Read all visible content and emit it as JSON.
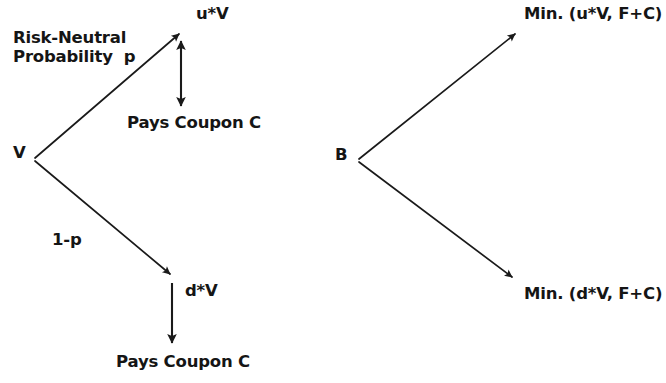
{
  "figure": {
    "background_color": "#ffffff",
    "ink_color": "#1a1a1a"
  },
  "left_panel": {
    "name": "firm-value-tree",
    "root_node": "V",
    "up_branch": {
      "probability_label": "Risk-Neutral\nProbability  p",
      "outcome_label": "u*V",
      "coupon_label": "Pays Coupon C"
    },
    "down_branch": {
      "probability_label": "1-p",
      "outcome_label": "d*V",
      "coupon_label": "Pays Coupon C"
    }
  },
  "right_panel": {
    "name": "bond-value-tree",
    "root_node": "B",
    "up_branch": {
      "outcome_label": "Min. (u*V, F+C)"
    },
    "down_branch": {
      "outcome_label": "Min. (d*V, F+C)"
    }
  },
  "geometry": {
    "left_tree": {
      "vertex": [
        33,
        159
      ],
      "up_arrow_tip": [
        181,
        32
      ],
      "down_arrow_tip": [
        172,
        276
      ],
      "up_coupon_arrow": [
        181,
        36,
        181,
        111
      ],
      "down_coupon_arrow": [
        172,
        281,
        172,
        348
      ]
    },
    "right_tree": {
      "vertex": [
        357,
        160
      ],
      "up_arrow_tip": [
        517,
        32
      ],
      "down_arrow_tip": [
        514,
        279
      ]
    }
  }
}
